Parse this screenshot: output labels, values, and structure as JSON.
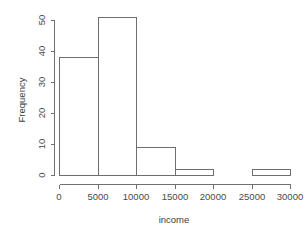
{
  "chart_data": {
    "type": "bar",
    "title": "",
    "subtitle": "",
    "xlabel": "income",
    "ylabel": "Frequency",
    "bin_width": 5000,
    "bin_edges": [
      0,
      5000,
      10000,
      15000,
      20000,
      25000,
      30000
    ],
    "categories": [
      "0-5000",
      "5000-10000",
      "10000-15000",
      "15000-20000",
      "20000-25000",
      "25000-30000"
    ],
    "values": [
      38,
      51,
      9,
      2,
      0,
      2
    ],
    "xlim": [
      0,
      30000
    ],
    "ylim": [
      0,
      51
    ],
    "x_ticks": [
      0,
      5000,
      10000,
      15000,
      20000,
      25000,
      30000
    ],
    "x_tick_labels": [
      "0",
      "5000",
      "10000",
      "15000",
      "20000",
      "25000",
      "30000"
    ],
    "y_ticks": [
      0,
      10,
      20,
      30,
      40,
      50
    ],
    "y_tick_labels": [
      "0",
      "10",
      "20",
      "30",
      "40",
      "50"
    ],
    "grid": false,
    "legend": false,
    "legend_position": "none",
    "bar_fill": "#ffffff",
    "bar_stroke": "#6e6e6e",
    "axis_color": "#707070",
    "background": "#ffffff",
    "annotations": []
  },
  "axis": {
    "x_title": "income",
    "y_title": "Frequency"
  },
  "x_tick_labels": {
    "t0": "0",
    "t1": "5000",
    "t2": "10000",
    "t3": "15000",
    "t4": "20000",
    "t5": "25000",
    "t6": "30000"
  },
  "y_tick_labels": {
    "t0": "0",
    "t1": "10",
    "t2": "20",
    "t3": "30",
    "t4": "40",
    "t5": "50"
  }
}
